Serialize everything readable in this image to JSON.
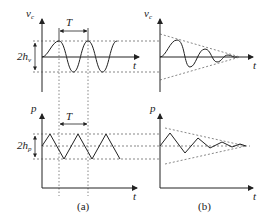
{
  "panels": {
    "a": {
      "caption": "(a)",
      "top": {
        "y_axis_label": "v",
        "y_axis_sub": "c",
        "x_axis_label": "t",
        "amplitude_label": "2h",
        "amplitude_sub": "v",
        "period_label": "T",
        "waveform": "sinusoidal sustained oscillation"
      },
      "bottom": {
        "y_axis_label": "p",
        "x_axis_label": "t",
        "amplitude_label": "2h",
        "amplitude_sub": "p",
        "period_label": "T",
        "waveform": "triangular sustained oscillation"
      }
    },
    "b": {
      "caption": "(b)",
      "top": {
        "y_axis_label": "v",
        "y_axis_sub": "c",
        "x_axis_label": "t",
        "waveform": "damped sinusoidal oscillation with decaying envelope"
      },
      "bottom": {
        "y_axis_label": "p",
        "x_axis_label": "t",
        "waveform": "damped triangular oscillation with decaying envelope"
      }
    }
  },
  "colors": {
    "line": "#222222",
    "dashed": "#555555"
  }
}
